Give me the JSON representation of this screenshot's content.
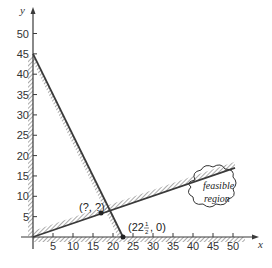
{
  "chart_data": {
    "type": "line",
    "title": "",
    "xlabel": "x",
    "ylabel": "y",
    "xlim": [
      0,
      55
    ],
    "ylim": [
      0,
      55
    ],
    "x_ticks": [
      "5",
      "10",
      "15",
      "20",
      "25",
      "30",
      "35",
      "40",
      "45",
      "50"
    ],
    "y_ticks": [
      "5",
      "10",
      "15",
      "20",
      "25",
      "30",
      "35",
      "40",
      "45",
      "50"
    ],
    "grid": false,
    "series": [
      {
        "name": "constraint-1",
        "points": [
          [
            0,
            45
          ],
          [
            22.5,
            0
          ]
        ],
        "hatched_side": "lower-left"
      },
      {
        "name": "constraint-2",
        "points": [
          [
            0,
            0
          ],
          [
            50.5,
            17
          ]
        ],
        "hatched_side": "upper-left"
      }
    ],
    "boundaries": [
      {
        "name": "y-axis",
        "hatched_side": "left"
      },
      {
        "name": "x-axis",
        "hatched_side": "below"
      }
    ],
    "annotations": [
      {
        "text": "(?, ?)",
        "x": 17,
        "y": 6,
        "role": "intersection point"
      },
      {
        "text": "(22½, 0)",
        "x": 22.5,
        "y": 0,
        "role": "x-intercept point"
      },
      {
        "text": "feasible region",
        "x": 44,
        "y": 7,
        "role": "cloud label"
      }
    ]
  },
  "labels": {
    "y_axis": "y",
    "x_axis": "x",
    "intersection": "(?, ?)",
    "intercept_main": "(22",
    "intercept_num": "1",
    "intercept_den": "2",
    "intercept_tail": ", 0)",
    "cloud_line1": "feasible",
    "cloud_line2": "region"
  },
  "colors": {
    "line": "#3a3a3a",
    "hatch": "#4a4a4a",
    "text": "#333333",
    "background": "#ffffff"
  }
}
